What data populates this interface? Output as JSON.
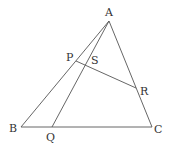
{
  "diagram": {
    "type": "geometry-triangle",
    "points": {
      "A": {
        "label": "A",
        "x": 109,
        "y": 21,
        "lx": 105,
        "ly": 16
      },
      "B": {
        "label": "B",
        "x": 21,
        "y": 127,
        "lx": 9,
        "ly": 132
      },
      "C": {
        "label": "C",
        "x": 152,
        "y": 127,
        "lx": 154,
        "ly": 133
      },
      "P": {
        "label": "P",
        "x": 76,
        "y": 61,
        "lx": 66,
        "ly": 61
      },
      "Q": {
        "label": "Q",
        "x": 52,
        "y": 127,
        "lx": 46,
        "ly": 141
      },
      "R": {
        "label": "R",
        "x": 136,
        "y": 88,
        "lx": 140,
        "ly": 95
      },
      "S": {
        "label": "S",
        "x": 85,
        "y": 66,
        "lx": 91,
        "ly": 64
      }
    },
    "segments": [
      {
        "from": "A",
        "to": "B"
      },
      {
        "from": "A",
        "to": "C"
      },
      {
        "from": "B",
        "to": "C"
      },
      {
        "from": "A",
        "to": "Q"
      },
      {
        "from": "P",
        "to": "R"
      }
    ],
    "colors": {
      "line": "#555555",
      "text": "#333333",
      "background": "#ffffff"
    }
  }
}
